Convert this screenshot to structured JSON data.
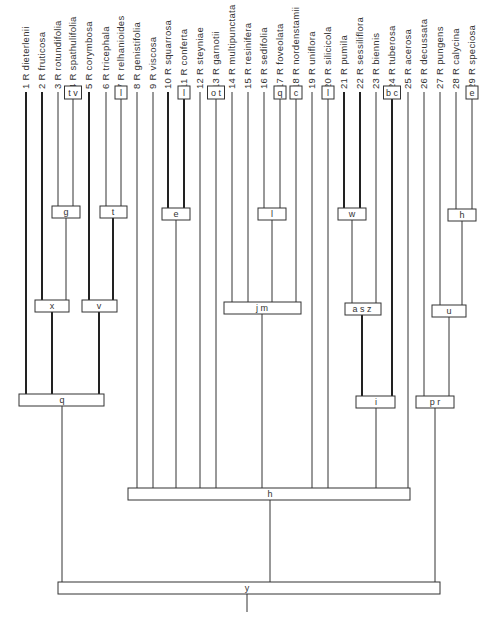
{
  "diagram": {
    "type": "cladogram",
    "taxa": [
      {
        "id": 1,
        "label": "1 R dieterlenii",
        "x": 26
      },
      {
        "id": 2,
        "label": "2 R fruticosa",
        "x": 42
      },
      {
        "id": 3,
        "label": "3 R rotundifolia",
        "x": 58
      },
      {
        "id": 4,
        "label": "4 R spathulifolia",
        "x": 73
      },
      {
        "id": 5,
        "label": "5 R corymbosa",
        "x": 89
      },
      {
        "id": 6,
        "label": "6 R tricephala",
        "x": 106
      },
      {
        "id": 7,
        "label": "7 R relhanioides",
        "x": 121
      },
      {
        "id": 8,
        "label": "8 R genistifolia",
        "x": 137
      },
      {
        "id": 9,
        "label": "9 R viscosa",
        "x": 153
      },
      {
        "id": 10,
        "label": "10 R squarrosa",
        "x": 168
      },
      {
        "id": 11,
        "label": "11 R conferta",
        "x": 184
      },
      {
        "id": 12,
        "label": "12 R steyniae",
        "x": 200
      },
      {
        "id": 13,
        "label": "13 R garnotii",
        "x": 216
      },
      {
        "id": 14,
        "label": "14 R multipunctata",
        "x": 232
      },
      {
        "id": 15,
        "label": "15 R resinifera",
        "x": 248
      },
      {
        "id": 16,
        "label": "16 R sedifolia",
        "x": 264
      },
      {
        "id": 17,
        "label": "17 R foveolata",
        "x": 280
      },
      {
        "id": 18,
        "label": "18 R nordenstamii",
        "x": 296
      },
      {
        "id": 19,
        "label": "19 R uniflora",
        "x": 312
      },
      {
        "id": 20,
        "label": "20 R silicicola",
        "x": 328
      },
      {
        "id": 21,
        "label": "21 R pumila",
        "x": 344
      },
      {
        "id": 22,
        "label": "22 R sessiliflora",
        "x": 360
      },
      {
        "id": 23,
        "label": "23 R biennis",
        "x": 376
      },
      {
        "id": 24,
        "label": "24 R tuberosa",
        "x": 392
      },
      {
        "id": 25,
        "label": "25 R acerosa",
        "x": 408
      },
      {
        "id": 26,
        "label": "26 R decussata",
        "x": 424
      },
      {
        "id": 27,
        "label": "27 R pungens",
        "x": 440
      },
      {
        "id": 28,
        "label": "28 R calycina",
        "x": 456
      },
      {
        "id": 29,
        "label": "29 R speciosa",
        "x": 472
      }
    ],
    "terminal_boxes": [
      {
        "label": "t v",
        "taxon": 4
      },
      {
        "label": "l",
        "taxon": 7
      },
      {
        "label": "l",
        "taxon": 11
      },
      {
        "label": "o t",
        "taxon": 13
      },
      {
        "label": "q",
        "taxon": 17
      },
      {
        "label": "c",
        "taxon": 18
      },
      {
        "label": "l",
        "taxon": 20
      },
      {
        "label": "b c",
        "taxon": 24
      },
      {
        "label": "e",
        "taxon": 29
      }
    ],
    "nodes": [
      {
        "label": "g",
        "x1": 52,
        "x2": 80,
        "y": 206,
        "children_x": [
          58,
          73
        ],
        "out_x": 66
      },
      {
        "label": "t",
        "x1": 100,
        "x2": 127,
        "y": 206,
        "children_x": [
          106,
          121
        ],
        "out_x": 113
      },
      {
        "label": "e",
        "x1": 162,
        "x2": 190,
        "y": 208,
        "children_x": [
          168,
          184
        ],
        "out_x": 176
      },
      {
        "label": "l",
        "x1": 258,
        "x2": 286,
        "y": 208,
        "children_x": [
          264,
          280
        ],
        "out_x": 272
      },
      {
        "label": "w",
        "x1": 338,
        "x2": 366,
        "y": 208,
        "children_x": [
          344,
          360
        ],
        "out_x": 352
      },
      {
        "label": "h",
        "x1": 448,
        "x2": 476,
        "y": 209,
        "children_x": [
          456,
          472
        ],
        "out_x": 462
      },
      {
        "label": "x",
        "x1": 35,
        "x2": 69,
        "y": 300,
        "children_x": [
          42,
          66
        ],
        "out_x": 52
      },
      {
        "label": "v",
        "x1": 82,
        "x2": 117,
        "y": 300,
        "children_x": [
          89,
          113
        ],
        "out_x": 99
      },
      {
        "label": "j m",
        "x1": 224,
        "x2": 301,
        "y": 302,
        "children_x": [
          232,
          248,
          272,
          296
        ],
        "out_x": 262
      },
      {
        "label": "a s z",
        "x1": 345,
        "x2": 381,
        "y": 303,
        "children_x": [
          352,
          376
        ],
        "out_x": 362
      },
      {
        "label": "u",
        "x1": 432,
        "x2": 466,
        "y": 305,
        "children_x": [
          440,
          462
        ],
        "out_x": 449
      },
      {
        "label": "q",
        "x1": 19,
        "x2": 104,
        "y": 394,
        "children_x": [
          26,
          52,
          99
        ],
        "out_x": 62
      },
      {
        "label": "i",
        "x1": 356,
        "x2": 395,
        "y": 396,
        "children_x": [
          362,
          392
        ],
        "out_x": 376
      },
      {
        "label": "p r",
        "x1": 416,
        "x2": 454,
        "y": 396,
        "children_x": [
          424,
          449
        ],
        "out_x": 435
      },
      {
        "label": "h",
        "x1": 128,
        "x2": 410,
        "y": 488,
        "children_x": [
          137,
          153,
          176,
          200,
          216,
          262,
          312,
          328,
          376,
          408
        ],
        "out_x": 270
      },
      {
        "label": "y",
        "x1": 58,
        "x2": 440,
        "y": 582,
        "children_x": [
          62,
          270,
          435
        ],
        "out_x": 247
      }
    ]
  }
}
